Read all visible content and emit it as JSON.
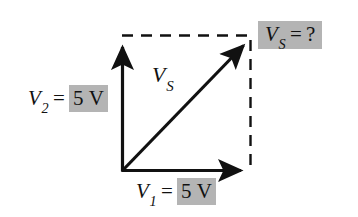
{
  "figure": {
    "background_color": "#ffffff",
    "stroke_color": "#111111",
    "highlight_color": "#b4b4b4",
    "axis_label_v2": {
      "variable": "V",
      "subscript": "2",
      "equals": "=",
      "value": "5 V"
    },
    "axis_label_v1": {
      "variable": "V",
      "subscript": "1",
      "equals": "=",
      "value": "5 V"
    },
    "resultant_label": {
      "variable": "V",
      "subscript": "S"
    },
    "resultant_box": {
      "variable": "V",
      "subscript": "S",
      "equals": "=",
      "value": "?"
    },
    "geometry": {
      "origin_x": 122,
      "origin_y": 171,
      "corner_x": 250,
      "corner_y": 38,
      "x_axis_tip_x": 248,
      "y_axis_tip_y": 40
    }
  }
}
